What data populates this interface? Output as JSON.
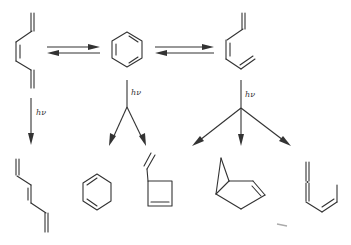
{
  "diagram": {
    "type": "photochemical reaction scheme",
    "colors": {
      "ink": "#333333",
      "background": "#ffffff"
    },
    "top_row": {
      "molecules": [
        {
          "id": "cis-hexatriene-left",
          "name": "(Z)-1,3,5-hexatriene (s-cis conformer)"
        },
        {
          "id": "benzene",
          "name": "benzene"
        },
        {
          "id": "cis-hexatriene-right",
          "name": "(Z)-1,3,5-hexatriene (conformer)"
        }
      ],
      "equilibria": [
        {
          "from": "cis-hexatriene-left",
          "to": "benzene",
          "symbol": "⇌"
        },
        {
          "from": "benzene",
          "to": "cis-hexatriene-right",
          "symbol": "⇌"
        }
      ]
    },
    "photolysis_labels": [
      {
        "id": "hv-left",
        "text": "hν"
      },
      {
        "id": "hv-middle",
        "text": "hν"
      },
      {
        "id": "hv-right",
        "text": "hν"
      }
    ],
    "products": [
      {
        "id": "trans-hexatriene",
        "name": "(E)-1,3,5-hexatriene"
      },
      {
        "id": "cyclohexadiene",
        "name": "1,3-cyclohexadiene"
      },
      {
        "id": "vinylcyclobutene",
        "name": "3-vinylcyclobutene"
      },
      {
        "id": "bicyclohexene",
        "name": "bicyclo[3.1.0]hex-2-ene"
      },
      {
        "id": "allenyl-butadiene",
        "name": "1,2,4-hexatriene (allene)"
      }
    ]
  }
}
